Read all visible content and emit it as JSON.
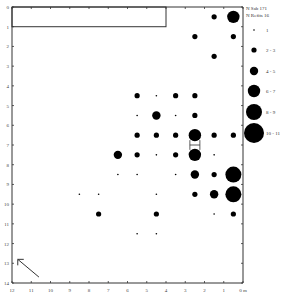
{
  "chart_data": {
    "type": "scatter",
    "subtype": "proportional-symbol-grid",
    "title": "",
    "xlabel": "m",
    "ylabel": "",
    "xlim": [
      12,
      0
    ],
    "ylim": [
      0,
      14
    ],
    "x_ticks": [
      "12",
      "11",
      "10",
      "9",
      "8",
      "7",
      "6",
      "5",
      "4",
      "3",
      "2",
      "1",
      "0 m"
    ],
    "y_ticks": [
      "0",
      "1",
      "2",
      "3",
      "4",
      "5",
      "6",
      "7",
      "8",
      "9",
      "10",
      "11",
      "12",
      "13",
      "14"
    ],
    "grid": false,
    "legend_position": "right",
    "legend_header": [
      "N Sab 171",
      "N Refits 16"
    ],
    "legend": [
      {
        "label": "1",
        "r": 0.8
      },
      {
        "label": "2 - 3",
        "r": 2.6
      },
      {
        "label": "4 - 5",
        "r": 4.2
      },
      {
        "label": "6 - 7",
        "r": 6.2
      },
      {
        "label": "8 - 9",
        "r": 8.0
      },
      {
        "label": "10 - 11",
        "r": 10.0
      }
    ],
    "annotations": [
      {
        "type": "rectangle",
        "x0": 12,
        "x1": 4,
        "y0": 0,
        "y1": 1
      },
      {
        "type": "arrow",
        "direction": "north-west",
        "from": [
          10.6,
          13.7
        ],
        "to": [
          11.7,
          12.8
        ]
      },
      {
        "type": "refit-link",
        "x": 2.5,
        "y0": 6.5,
        "y1": 7.5
      }
    ],
    "points": [
      {
        "x": 1.5,
        "y": 0.5,
        "class": "2 - 3"
      },
      {
        "x": 0.5,
        "y": 0.5,
        "class": "6 - 7"
      },
      {
        "x": 2.5,
        "y": 1.5,
        "class": "2 - 3"
      },
      {
        "x": 0.5,
        "y": 1.5,
        "class": "2 - 3"
      },
      {
        "x": 1.5,
        "y": 2.5,
        "class": "2 - 3"
      },
      {
        "x": 5.5,
        "y": 4.5,
        "class": "2 - 3"
      },
      {
        "x": 4.5,
        "y": 4.5,
        "class": "1"
      },
      {
        "x": 3.5,
        "y": 4.5,
        "class": "2 - 3"
      },
      {
        "x": 2.5,
        "y": 4.5,
        "class": "2 - 3"
      },
      {
        "x": 5.5,
        "y": 5.5,
        "class": "1"
      },
      {
        "x": 4.5,
        "y": 5.5,
        "class": "4 - 5"
      },
      {
        "x": 3.5,
        "y": 5.5,
        "class": "1"
      },
      {
        "x": 2.5,
        "y": 5.5,
        "class": "2 - 3"
      },
      {
        "x": 5.5,
        "y": 6.5,
        "class": "2 - 3"
      },
      {
        "x": 4.5,
        "y": 6.5,
        "class": "2 - 3"
      },
      {
        "x": 3.5,
        "y": 6.5,
        "class": "2 - 3"
      },
      {
        "x": 2.5,
        "y": 6.5,
        "class": "6 - 7"
      },
      {
        "x": 1.5,
        "y": 6.5,
        "class": "2 - 3"
      },
      {
        "x": 0.5,
        "y": 6.5,
        "class": "2 - 3"
      },
      {
        "x": 6.5,
        "y": 7.5,
        "class": "4 - 5"
      },
      {
        "x": 5.5,
        "y": 7.5,
        "class": "2 - 3"
      },
      {
        "x": 4.5,
        "y": 7.5,
        "class": "1"
      },
      {
        "x": 3.5,
        "y": 7.5,
        "class": "2 - 3"
      },
      {
        "x": 2.5,
        "y": 7.5,
        "class": "6 - 7"
      },
      {
        "x": 1.5,
        "y": 7.5,
        "class": "1"
      },
      {
        "x": 6.5,
        "y": 8.5,
        "class": "1"
      },
      {
        "x": 5.5,
        "y": 8.5,
        "class": "1"
      },
      {
        "x": 3.5,
        "y": 8.5,
        "class": "1"
      },
      {
        "x": 2.5,
        "y": 8.5,
        "class": "4 - 5"
      },
      {
        "x": 1.5,
        "y": 8.5,
        "class": "2 - 3"
      },
      {
        "x": 0.5,
        "y": 8.5,
        "class": "8 - 9"
      },
      {
        "x": 8.5,
        "y": 9.5,
        "class": "1"
      },
      {
        "x": 7.5,
        "y": 9.5,
        "class": "1"
      },
      {
        "x": 4.5,
        "y": 9.5,
        "class": "1"
      },
      {
        "x": 2.5,
        "y": 9.5,
        "class": "2 - 3"
      },
      {
        "x": 1.5,
        "y": 9.5,
        "class": "4 - 5"
      },
      {
        "x": 0.5,
        "y": 9.5,
        "class": "8 - 9"
      },
      {
        "x": 7.5,
        "y": 10.5,
        "class": "2 - 3"
      },
      {
        "x": 4.5,
        "y": 10.5,
        "class": "2 - 3"
      },
      {
        "x": 1.5,
        "y": 10.5,
        "class": "1"
      },
      {
        "x": 0.5,
        "y": 10.5,
        "class": "2 - 3"
      },
      {
        "x": 5.5,
        "y": 11.5,
        "class": "1"
      },
      {
        "x": 4.5,
        "y": 11.5,
        "class": "1"
      }
    ]
  },
  "colors": {
    "ink": "#000000",
    "axis": "#333333",
    "background": "#ffffff"
  }
}
